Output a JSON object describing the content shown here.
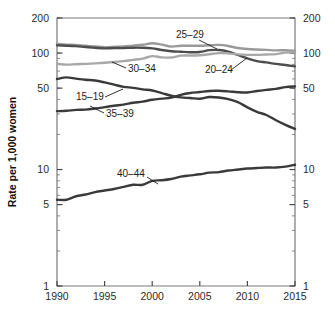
{
  "chart_data": {
    "type": "line",
    "title": "",
    "xlabel": "",
    "ylabel": "Rate per 1,000 women",
    "yscale": "log",
    "ylim": [
      1,
      200
    ],
    "xlim": [
      1990,
      2015
    ],
    "grid": false,
    "legend_position": "inline-annotations",
    "x_ticks": [
      "1990",
      "1995",
      "2000",
      "2005",
      "2010",
      "2015"
    ],
    "x_tick_values": [
      1990,
      1995,
      2000,
      2005,
      2010,
      2015
    ],
    "y_ticks": [
      "200",
      "100",
      "50",
      "10",
      "5",
      "1"
    ],
    "y_tick_values": [
      200,
      100,
      50,
      10,
      5,
      1
    ],
    "y_ticks_right": [
      "200",
      "100",
      "50",
      "10",
      "5",
      "1"
    ],
    "x": [
      1990,
      1991,
      1992,
      1993,
      1994,
      1995,
      1996,
      1997,
      1998,
      1999,
      2000,
      2001,
      2002,
      2003,
      2004,
      2005,
      2006,
      2007,
      2008,
      2009,
      2010,
      2011,
      2012,
      2013,
      2014,
      2015
    ],
    "series": [
      {
        "name": "25-29",
        "label": "25–29",
        "color": "#9a9a9a",
        "values": [
          120.2,
          118.2,
          117.4,
          115.5,
          113.9,
          112.2,
          113.1,
          113.8,
          115.9,
          117.8,
          121.4,
          118.0,
          113.6,
          115.6,
          115.5,
          115.6,
          116.7,
          117.5,
          115.1,
          110.5,
          108.3,
          107.2,
          106.5,
          105.5,
          105.8,
          104.3
        ]
      },
      {
        "name": "20-24",
        "label": "20–24",
        "color": "#4d4d4d",
        "values": [
          116.5,
          115.7,
          114.6,
          112.6,
          111.1,
          109.8,
          110.4,
          110.4,
          111.2,
          111.0,
          109.7,
          106.2,
          103.6,
          102.6,
          101.7,
          102.2,
          105.9,
          106.3,
          103.0,
          96.3,
          90.0,
          85.3,
          83.1,
          80.7,
          79.0,
          76.8
        ]
      },
      {
        "name": "30-34",
        "label": "30–34",
        "color": "#a8a8a8",
        "values": [
          80.8,
          79.5,
          80.2,
          80.8,
          81.5,
          82.5,
          83.9,
          85.3,
          87.4,
          89.6,
          94.1,
          91.9,
          91.5,
          95.1,
          95.3,
          95.9,
          97.7,
          99.9,
          99.3,
          97.5,
          96.5,
          96.5,
          97.3,
          98.0,
          100.8,
          101.5
        ]
      },
      {
        "name": "15-19",
        "label": "15–19",
        "color": "#3a3a3a",
        "values": [
          59.9,
          61.8,
          60.3,
          59.0,
          58.2,
          56.0,
          53.5,
          51.3,
          50.3,
          48.8,
          47.7,
          45.3,
          43.0,
          41.6,
          41.1,
          40.5,
          41.9,
          41.5,
          40.2,
          37.9,
          34.2,
          31.3,
          29.4,
          26.5,
          24.2,
          22.3
        ]
      },
      {
        "name": "35-39",
        "label": "35–39",
        "color": "#3a3a3a",
        "values": [
          31.7,
          32.0,
          32.5,
          32.7,
          33.4,
          34.3,
          35.3,
          36.1,
          37.4,
          38.3,
          39.7,
          40.6,
          41.4,
          43.8,
          45.4,
          46.3,
          47.3,
          47.5,
          46.9,
          46.1,
          45.9,
          47.2,
          48.3,
          49.3,
          51.0,
          51.8
        ]
      },
      {
        "name": "40-44",
        "label": "40–44",
        "color": "#3a3a3a",
        "values": [
          5.5,
          5.5,
          5.9,
          6.1,
          6.4,
          6.6,
          6.8,
          7.1,
          7.4,
          7.4,
          8.0,
          8.1,
          8.3,
          8.7,
          8.9,
          9.1,
          9.4,
          9.5,
          9.8,
          10.0,
          10.2,
          10.3,
          10.4,
          10.4,
          10.6,
          11.0
        ]
      }
    ],
    "annotations": [
      {
        "text": "25–29",
        "x": 176,
        "y": 38,
        "leader": [
          [
            199,
            40
          ],
          [
            217,
            49
          ]
        ]
      },
      {
        "text": "30–34",
        "x": 128,
        "y": 72,
        "leader": [
          [
            126,
            68
          ],
          [
            112,
            62
          ]
        ]
      },
      {
        "text": "20–24",
        "x": 205,
        "y": 73,
        "leader": [
          [
            231,
            70
          ],
          [
            247,
            58
          ]
        ]
      },
      {
        "text": "15–19",
        "x": 76,
        "y": 100,
        "leader": [
          [
            105,
            97
          ],
          [
            123,
            89
          ]
        ]
      },
      {
        "text": "35–39",
        "x": 106,
        "y": 117,
        "leader": [
          [
            104,
            113
          ],
          [
            90,
            106
          ]
        ]
      },
      {
        "text": "40–44",
        "x": 117,
        "y": 177,
        "leader": [
          [
            147,
            177
          ],
          [
            158,
            184
          ]
        ]
      }
    ]
  },
  "axes": {
    "y_axis_title": "Rate per 1,000 women"
  }
}
